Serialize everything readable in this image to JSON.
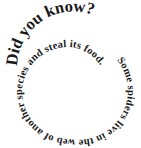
{
  "graphic": {
    "title": "Did you know?",
    "fact_part1": "Some spiders live in the web of another species",
    "fact_part2": "and steal its food.",
    "text_color": "#1a1a1a",
    "background_color": "#ffffff"
  }
}
